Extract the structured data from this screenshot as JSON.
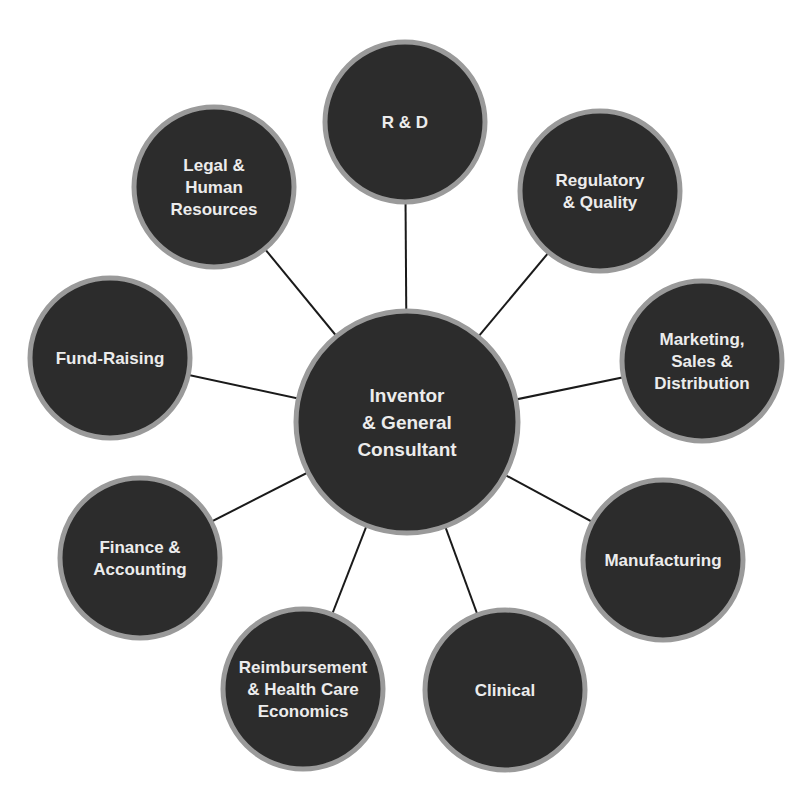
{
  "diagram": {
    "type": "hub-and-spoke",
    "colors": {
      "node_fill": "#2c2c2c",
      "node_ring": "#9a9a9a",
      "connector": "#1a1a1a",
      "label": "#ececec",
      "background": "#ffffff"
    },
    "center": {
      "id": "inventor",
      "lines": [
        "Inventor",
        "& General",
        "Consultant"
      ],
      "cx": 407,
      "cy": 422,
      "r": 111
    },
    "nodes": [
      {
        "id": "r-and-d",
        "lines": [
          "R & D"
        ],
        "cx": 405,
        "cy": 122,
        "r": 80
      },
      {
        "id": "regulatory-quality",
        "lines": [
          "Regulatory",
          "& Quality"
        ],
        "cx": 600,
        "cy": 191,
        "r": 80
      },
      {
        "id": "marketing-sales-distribution",
        "lines": [
          "Marketing,",
          "Sales &",
          "Distribution"
        ],
        "cx": 702,
        "cy": 361,
        "r": 80
      },
      {
        "id": "manufacturing",
        "lines": [
          "Manufacturing"
        ],
        "cx": 663,
        "cy": 560,
        "r": 80
      },
      {
        "id": "clinical",
        "lines": [
          "Clinical"
        ],
        "cx": 505,
        "cy": 690,
        "r": 80
      },
      {
        "id": "reimbursement-health-care-economics",
        "lines": [
          "Reimbursement",
          "& Health Care",
          "Economics"
        ],
        "cx": 303,
        "cy": 689,
        "r": 80
      },
      {
        "id": "finance-accounting",
        "lines": [
          "Finance &",
          "Accounting"
        ],
        "cx": 140,
        "cy": 558,
        "r": 80
      },
      {
        "id": "fund-raising",
        "lines": [
          "Fund-Raising"
        ],
        "cx": 110,
        "cy": 358,
        "r": 80
      },
      {
        "id": "legal-human-resources",
        "lines": [
          "Legal &",
          "Human",
          "Resources"
        ],
        "cx": 214,
        "cy": 187,
        "r": 80
      }
    ]
  }
}
